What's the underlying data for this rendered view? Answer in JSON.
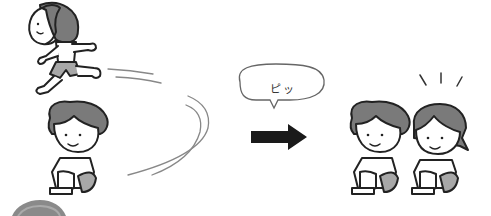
{
  "illustration": {
    "description": "Running child circles around seated child; whistle sound; two children seated side by side",
    "speech_bubble": {
      "text": "ピッ"
    },
    "colors": {
      "outline": "#222222",
      "hair": "#7a7a7a",
      "shorts": "#a8a8a8",
      "skin": "#ffffff",
      "motion_lines": "#888888",
      "arrow": "#1a1a1a",
      "bottom_circle": "#8a8a8a"
    },
    "scenes": [
      {
        "label": "running-child"
      },
      {
        "label": "seated-boy-left"
      },
      {
        "label": "arrow-right"
      },
      {
        "label": "seated-boy-right"
      },
      {
        "label": "seated-girl-right"
      }
    ]
  }
}
